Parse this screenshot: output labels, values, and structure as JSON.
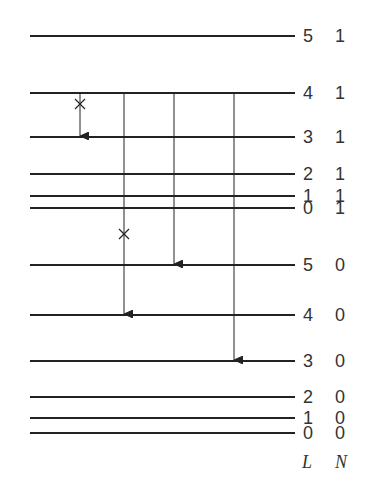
{
  "diagram": {
    "title": "",
    "column_headers": {
      "L": "L",
      "N": "N"
    },
    "levels": [
      {
        "L": "5",
        "N": "1",
        "y": 36
      },
      {
        "L": "4",
        "N": "1",
        "y": 93
      },
      {
        "L": "3",
        "N": "1",
        "y": 137
      },
      {
        "L": "2",
        "N": "1",
        "y": 174
      },
      {
        "L": "1",
        "N": "1",
        "y": 196
      },
      {
        "L": "0",
        "N": "1",
        "y": 208
      },
      {
        "L": "5",
        "N": "0",
        "y": 265
      },
      {
        "L": "4",
        "N": "0",
        "y": 315
      },
      {
        "L": "3",
        "N": "0",
        "y": 361
      },
      {
        "L": "2",
        "N": "0",
        "y": 397
      },
      {
        "L": "1",
        "N": "0",
        "y": 418
      },
      {
        "L": "0",
        "N": "0",
        "y": 433
      }
    ],
    "transitions": [
      {
        "from": "4 1",
        "to": "3 1",
        "x": 80,
        "forbidden": true
      },
      {
        "from": "4 1",
        "to": "4 0",
        "x": 124,
        "forbidden": true
      },
      {
        "from": "4 1",
        "to": "5 0",
        "x": 174,
        "forbidden": false
      },
      {
        "from": "4 1",
        "to": "3 0",
        "x": 234,
        "forbidden": false
      }
    ],
    "forbidden_marker": "×"
  }
}
